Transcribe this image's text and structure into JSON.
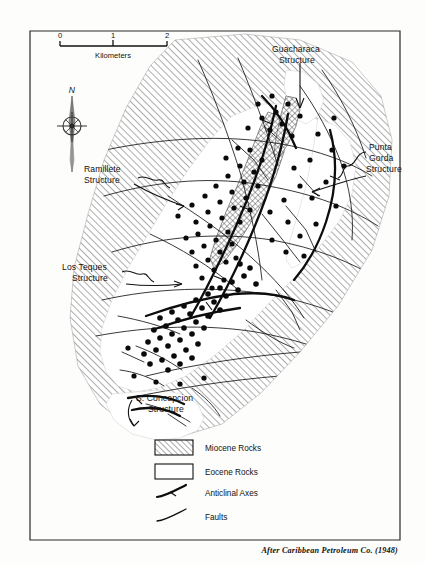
{
  "figure": {
    "type": "geologic-map",
    "credit": "After Caribbean Petroleum Co. (1948)"
  },
  "scale_bar": {
    "ticks": [
      "0",
      "1",
      "2"
    ],
    "units_label": "Kilometers"
  },
  "compass": {
    "north_label": "N"
  },
  "structures": [
    {
      "id": "guacharaca",
      "line1": "Guacharaca",
      "line2": "Structure"
    },
    {
      "id": "punta-gorda",
      "line1": "Punta",
      "line2": "Gorda",
      "line3": "Structure"
    },
    {
      "id": "ramillete",
      "line1": "Ramillete",
      "line2": "Structure"
    },
    {
      "id": "los-teques",
      "line1": "Los Teques",
      "line2": "Structure"
    },
    {
      "id": "s-concepcion",
      "line1": "S. Concepcion",
      "line2": "Structure"
    }
  ],
  "legend": {
    "items": [
      {
        "id": "miocene",
        "label": "Miocene Rocks",
        "symbol": "hatched-box"
      },
      {
        "id": "eocene",
        "label": "Eocene Rocks",
        "symbol": "white-box"
      },
      {
        "id": "anticlinal",
        "label": "Anticlinal Axes",
        "symbol": "axis-curve"
      },
      {
        "id": "faults",
        "label": "Faults",
        "symbol": "fault-curve"
      }
    ]
  },
  "colors": {
    "ink": "#111111",
    "hatch": "#6e6e6e",
    "paper": "#fdfdfc",
    "eocene_fill": "#ffffff"
  },
  "map_content": {
    "units": [
      "Miocene Rocks",
      "Eocene Rocks"
    ],
    "line_types": [
      "Anticlinal Axes",
      "Faults"
    ],
    "well_symbol": "filled-circle"
  }
}
